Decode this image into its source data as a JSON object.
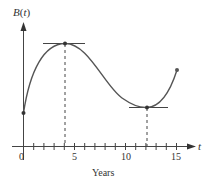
{
  "chart_data": {
    "type": "line",
    "title": "",
    "xlabel": "Years",
    "ylabel": "B(t)",
    "x_axis_symbol": "t",
    "x_ticks": [
      0,
      1,
      2,
      3,
      4,
      5,
      6,
      7,
      8,
      9,
      10,
      11,
      12,
      13,
      14,
      15
    ],
    "x_tick_labels": [
      "0",
      "5",
      "10",
      "15"
    ],
    "x_tick_label_values": [
      0,
      5,
      10,
      15
    ],
    "xlim": [
      0,
      16
    ],
    "y_ticks": [],
    "grid": false,
    "legend": null,
    "series": [
      {
        "name": "B(t)",
        "points": [
          {
            "t": 0,
            "B": 3.3
          },
          {
            "t": 1,
            "B": 6.5
          },
          {
            "t": 2,
            "B": 8.6
          },
          {
            "t": 3,
            "B": 9.6
          },
          {
            "t": 4,
            "B": 10.0
          },
          {
            "t": 5,
            "B": 9.7
          },
          {
            "t": 6,
            "B": 8.8
          },
          {
            "t": 7,
            "B": 7.5
          },
          {
            "t": 8,
            "B": 6.1
          },
          {
            "t": 9,
            "B": 4.9
          },
          {
            "t": 10,
            "B": 4.1
          },
          {
            "t": 11,
            "B": 3.7
          },
          {
            "t": 12,
            "B": 3.6
          },
          {
            "t": 13,
            "B": 3.9
          },
          {
            "t": 14,
            "B": 5.0
          },
          {
            "t": 15,
            "B": 7.0
          }
        ]
      }
    ],
    "annotations": [
      {
        "type": "local-maximum",
        "t": 4,
        "B": 10.0,
        "horizontal_tangent": true,
        "dashed_drop_line": true
      },
      {
        "type": "local-minimum",
        "t": 12,
        "B": 3.6,
        "horizontal_tangent": true,
        "dashed_drop_line": true
      },
      {
        "type": "endpoint",
        "t": 0,
        "B": 3.3
      },
      {
        "type": "endpoint",
        "t": 15,
        "B": 7.0
      }
    ]
  },
  "labels": {
    "y_axis": "B(t)",
    "x_axis_var": "t",
    "x_axis_title": "Years",
    "tick_0": "0",
    "tick_5": "5",
    "tick_10": "10",
    "tick_15": "15"
  }
}
